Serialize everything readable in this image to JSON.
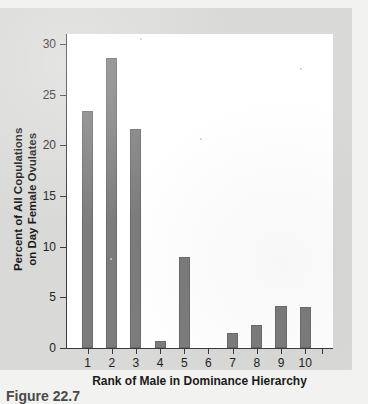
{
  "figure": {
    "caption": "Figure 22.7",
    "panel_bg": "#d9d9d7",
    "plot_bg": "#ffffff",
    "bar_color": "#7c7c7c",
    "axis_color": "#3a3a3a"
  },
  "chart_data": {
    "type": "bar",
    "title": "",
    "subtitle": "",
    "xlabel": "Rank of Male in Dominance Hierarchy",
    "ylabel": "Percent of All Copulations on Day Female Ovulates",
    "ylabel_lines": [
      "Percent of All Copulations",
      "on Day Female Ovulates"
    ],
    "categories": [
      "1",
      "2",
      "3",
      "4",
      "5",
      "6",
      "7",
      "8",
      "9",
      "10"
    ],
    "values": [
      23.4,
      28.6,
      21.6,
      0.7,
      9.0,
      0,
      1.5,
      2.3,
      4.1,
      4.0
    ],
    "yticks": [
      0,
      5,
      10,
      15,
      20,
      25,
      30
    ],
    "ytick_labels": [
      "0",
      "5",
      "10",
      "15",
      "20",
      "25",
      "30"
    ],
    "ylim": [
      0,
      31
    ],
    "grid": false,
    "legend": false,
    "legend_position": "none"
  }
}
